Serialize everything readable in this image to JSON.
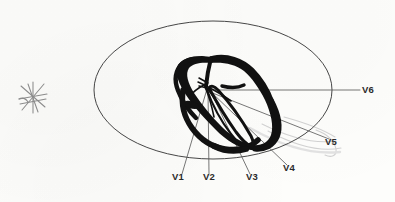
{
  "figure": {
    "type": "anatomical-diagram",
    "background_color": "#fdfdfb",
    "ink_color": "#1a1a1a",
    "line_color": "#4a4a4a",
    "faint_color": "#c9c9c9"
  },
  "torso_outline": {
    "shape": "ellipse",
    "cx": 213,
    "cy": 90,
    "rx": 119,
    "ry": 69,
    "stroke": "#3d3d3d",
    "stroke_width": 0.9
  },
  "heart": {
    "label": "heart-cross-section",
    "fill": "#111111",
    "bbox": {
      "x": 174,
      "y": 57,
      "width": 108,
      "height": 94
    }
  },
  "convergence_point": {
    "x": 207,
    "y": 88
  },
  "star_mark": {
    "name": "asterisk-mark",
    "cx": 33,
    "cy": 97,
    "radius": 15,
    "stroke": "#8e8e8e"
  },
  "leads": [
    {
      "label": "V1",
      "label_x": 172,
      "label_y": 178,
      "anchor_x": 182,
      "anchor_y": 174,
      "tip_x": 207,
      "tip_y": 89
    },
    {
      "label": "V2",
      "label_x": 203,
      "label_y": 178,
      "anchor_x": 209,
      "anchor_y": 174,
      "tip_x": 208,
      "tip_y": 89
    },
    {
      "label": "V3",
      "label_x": 246,
      "label_y": 178,
      "anchor_x": 250,
      "anchor_y": 174,
      "tip_x": 210,
      "tip_y": 90
    },
    {
      "label": "V4",
      "label_x": 283,
      "label_y": 169,
      "anchor_x": 287,
      "anchor_y": 165,
      "tip_x": 210,
      "tip_y": 91
    },
    {
      "label": "V5",
      "label_x": 325,
      "label_y": 141,
      "anchor_x": 329,
      "anchor_y": 139,
      "tip_x": 210,
      "tip_y": 92
    },
    {
      "label": "V6",
      "label_x": 362,
      "label_y": 86,
      "anchor_x": 360,
      "anchor_y": 90,
      "tip_x": 208,
      "tip_y": 90
    }
  ],
  "faint_arcs": [
    {
      "name": "erased-pencil-arc-1",
      "d": "M 262 124 C 290 138 316 144 336 141"
    },
    {
      "name": "erased-pencil-arc-2",
      "d": "M 268 131 C 296 146 322 152 341 148"
    },
    {
      "name": "erased-pencil-arc-3",
      "d": "M 284 118 C 306 124 322 129 334 136"
    }
  ]
}
